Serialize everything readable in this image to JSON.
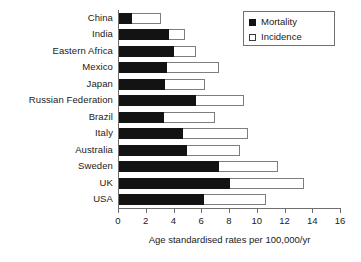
{
  "chart_data": {
    "type": "bar",
    "orientation": "horizontal",
    "stacked": false,
    "overlaid": true,
    "title": "",
    "subtitle": "",
    "xlabel": "Age standardised rates per 100,000/yr",
    "ylabel": "",
    "xlim": [
      0,
      16
    ],
    "xticks": [
      0,
      2,
      4,
      6,
      8,
      10,
      12,
      14,
      16
    ],
    "xtick_labels": [
      "0",
      "2",
      "4",
      "6",
      "8",
      "10",
      "12",
      "14",
      "16"
    ],
    "grid": false,
    "legend_position": "top-right",
    "legend": [
      "Mortality",
      "Incidence"
    ],
    "categories": [
      "China",
      "India",
      "Eastern Africa",
      "Mexico",
      "Japan",
      "Russian Federation",
      "Brazil",
      "Italy",
      "Australia",
      "Sweden",
      "UK",
      "USA"
    ],
    "series": [
      {
        "name": "Mortality",
        "color": "#131313",
        "values": [
          1.0,
          3.7,
          4.0,
          3.5,
          3.4,
          5.6,
          3.3,
          4.7,
          5.0,
          7.3,
          8.1,
          6.2
        ]
      },
      {
        "name": "Incidence",
        "color": "#ffffff",
        "values": [
          3.1,
          4.8,
          5.6,
          7.3,
          6.3,
          9.1,
          7.0,
          9.4,
          8.8,
          11.5,
          13.4,
          10.7
        ]
      }
    ]
  },
  "legend": {
    "items": [
      {
        "label": "Mortality",
        "swatch": "filled-square-icon"
      },
      {
        "label": "Incidence",
        "swatch": "hollow-square-icon"
      }
    ]
  },
  "axis": {
    "x_title": "Age standardised rates per 100,000/yr"
  },
  "colors": {
    "mortality": "#131313",
    "incidence": "#ffffff",
    "axis": "#6e6e6e",
    "bar_outline": "#7d7d7d",
    "background": "#ffffff"
  }
}
